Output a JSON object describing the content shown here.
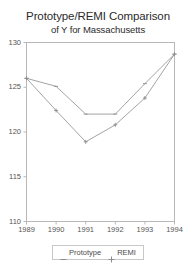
{
  "chart_data": {
    "type": "line",
    "title": "Prototype/REMI Comparison",
    "subtitle": "of Y for Massachusetts",
    "xlabel": "",
    "ylabel": "",
    "categories": [
      "1989",
      "1990",
      "1991",
      "1992",
      "1993",
      "1994"
    ],
    "x": [
      1989,
      1990,
      1991,
      1992,
      1993,
      1994
    ],
    "xlim": [
      1989,
      1994
    ],
    "ylim": [
      110,
      130
    ],
    "yticks": [
      110,
      115,
      120,
      125,
      130
    ],
    "xticks": [
      "1989",
      "1990",
      "1991",
      "1992",
      "1993",
      "1994"
    ],
    "grid": false,
    "legend_position": "bottom",
    "series": [
      {
        "name": "Prototype",
        "marker": "dash",
        "color": "#8c8c8c",
        "values": [
          126.0,
          125.1,
          122.0,
          122.0,
          125.4,
          128.7
        ]
      },
      {
        "name": "REMI",
        "marker": "plus",
        "color": "#8c8c8c",
        "values": [
          126.0,
          122.4,
          118.9,
          120.8,
          123.8,
          128.7
        ]
      }
    ]
  },
  "legend": {
    "entries": [
      {
        "label": "Prototype",
        "marker": "dash-marker"
      },
      {
        "label": "REMI",
        "marker": "plus-marker"
      }
    ]
  },
  "colors": {
    "axis": "#b0b0b0",
    "line": "#9a9a9a",
    "text": "#4a4a4a",
    "background": "#ffffff"
  }
}
